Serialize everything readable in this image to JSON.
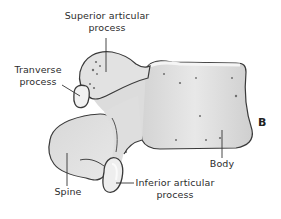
{
  "figure": {
    "panel_letter": "B",
    "labels": {
      "superior_articular": [
        "Superior articular",
        "process"
      ],
      "transverse": [
        "Tranverse",
        "process"
      ],
      "spine": "Spine",
      "inferior_articular": [
        "Inferior articular",
        "process"
      ],
      "body": "Body"
    },
    "colors": {
      "bone_fill": "#e4e4e4",
      "bone_shadow": "#bdbdbd",
      "outline": "#3a3a3a",
      "highlight": "#f7f7f7"
    }
  }
}
